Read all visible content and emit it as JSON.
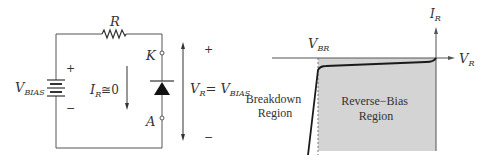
{
  "circuit": {
    "resistor_label": "R",
    "source_label_main": "V",
    "source_label_sub": "BIAS",
    "source_plus": "+",
    "source_minus": "−",
    "current_label_main": "I",
    "current_label_sub": "R",
    "current_label_rest": "≅0",
    "cathode_label": "K",
    "anode_label": "A",
    "voltage_label_main": "V",
    "voltage_label_sub": "R",
    "voltage_label_eq": "= V",
    "voltage_label_sub2": "BIAS",
    "voltage_plus": "+",
    "voltage_minus": "−"
  },
  "graph": {
    "y_axis_main": "I",
    "y_axis_sub": "R",
    "x_axis_main": "V",
    "x_axis_sub": "R",
    "vbr_main": "V",
    "vbr_sub": "BR",
    "breakdown_line1": "Breakdown",
    "breakdown_line2": "Region",
    "reverse_line1": "Reverse−Bias",
    "reverse_line2": "Region",
    "shade_color": "#d4d4d4",
    "curve_color": "#1a1a1a"
  }
}
